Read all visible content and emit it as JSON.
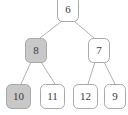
{
  "diagram": {
    "type": "binary-tree",
    "title": "",
    "background_color": "#ffffff",
    "node_border_color": "#a9a9a9",
    "edge_color": "#b0b0b0",
    "label_color": "#3b3b3b",
    "shaded_fill": "#c8c8c8",
    "unshaded_fill": "#ffffff",
    "nodes": [
      {
        "id": "root",
        "label": "6",
        "shaded": false,
        "level": 0,
        "x": 68,
        "y": 9,
        "width": 21,
        "height": 24,
        "clipped_top": true
      },
      {
        "id": "left",
        "label": "8",
        "shaded": true,
        "level": 1,
        "x": 35,
        "y": 50,
        "width": 21,
        "height": 24,
        "clipped_top": false
      },
      {
        "id": "right",
        "label": "7",
        "shaded": false,
        "level": 1,
        "x": 99,
        "y": 50,
        "width": 21,
        "height": 24,
        "clipped_top": false
      },
      {
        "id": "left-left",
        "label": "10",
        "shaded": true,
        "level": 2,
        "x": 18,
        "y": 96,
        "width": 24,
        "height": 24,
        "clipped_top": false
      },
      {
        "id": "left-right",
        "label": "11",
        "shaded": false,
        "level": 2,
        "x": 52,
        "y": 96,
        "width": 24,
        "height": 24,
        "clipped_top": false
      },
      {
        "id": "right-left",
        "label": "12",
        "shaded": false,
        "level": 2,
        "x": 85,
        "y": 96,
        "width": 24,
        "height": 24,
        "clipped_top": false
      },
      {
        "id": "right-right",
        "label": "9",
        "shaded": false,
        "level": 2,
        "x": 115,
        "y": 96,
        "width": 21,
        "height": 24,
        "clipped_top": false
      }
    ],
    "edges": [
      {
        "from": "root",
        "to": "left",
        "x1": 62,
        "y1": 21,
        "x2": 40,
        "y2": 38
      },
      {
        "from": "root",
        "to": "right",
        "x1": 74,
        "y1": 21,
        "x2": 94,
        "y2": 38
      },
      {
        "from": "left",
        "to": "left-left",
        "x1": 31,
        "y1": 62,
        "x2": 21,
        "y2": 84
      },
      {
        "from": "left",
        "to": "left-right",
        "x1": 41,
        "y1": 62,
        "x2": 55,
        "y2": 84
      },
      {
        "from": "right",
        "to": "right-left",
        "x1": 95,
        "y1": 62,
        "x2": 88,
        "y2": 84
      },
      {
        "from": "right",
        "to": "right-right",
        "x1": 104,
        "y1": 62,
        "x2": 115,
        "y2": 84
      }
    ]
  }
}
